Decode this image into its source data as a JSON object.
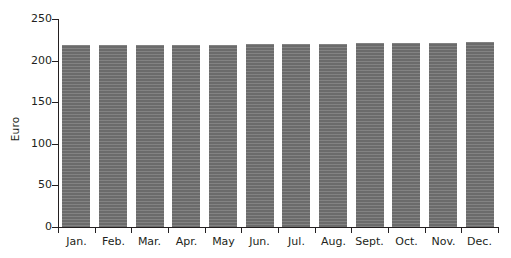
{
  "chart_data": {
    "type": "bar",
    "title": "",
    "xlabel": "",
    "ylabel": "Euro",
    "categories": [
      "Jan.",
      "Feb.",
      "Mar.",
      "Apr.",
      "May",
      "Jun.",
      "Jul.",
      "Aug.",
      "Sept.",
      "Oct.",
      "Nov.",
      "Dec."
    ],
    "values": [
      219,
      219,
      219,
      219,
      219,
      220,
      220,
      220,
      221,
      221,
      221,
      222
    ],
    "ylim": [
      0,
      250
    ],
    "yticks": [
      0,
      50,
      100,
      150,
      200,
      250
    ],
    "ytick_labels": [
      "0",
      "50",
      "100",
      "150",
      "200",
      "250"
    ],
    "grid": false,
    "legend": false,
    "series": [
      {
        "name": "Euro",
        "color": "#6b6b6b",
        "values": [
          219,
          219,
          219,
          219,
          219,
          220,
          220,
          220,
          221,
          221,
          221,
          222
        ]
      }
    ]
  },
  "colors": {
    "bar": "#6b6b6b",
    "axis": "#231f20",
    "background": "#ffffff"
  }
}
